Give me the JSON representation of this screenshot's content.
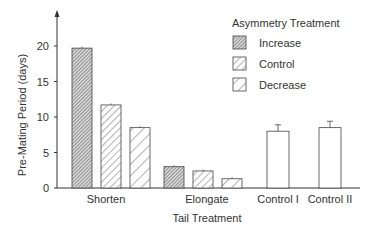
{
  "chart_data": {
    "type": "bar",
    "title": "",
    "xlabel": "Tail Treatment",
    "ylabel": "Pre-Mating Period (days)",
    "ylim": [
      0,
      24
    ],
    "yticks": [
      0,
      5,
      10,
      15,
      20
    ],
    "categories": [
      "Shorten",
      "Elongate",
      "Control I",
      "Control II"
    ],
    "legend_title": "Asymmetry Treatment",
    "series": [
      {
        "name": "Increase",
        "pattern": "dense-hatch",
        "values": [
          19.7,
          3.0,
          null,
          null
        ],
        "errors": [
          0.2,
          0.2,
          null,
          null
        ]
      },
      {
        "name": "Control",
        "pattern": "hatch",
        "values": [
          11.7,
          2.4,
          null,
          null
        ],
        "errors": [
          0.2,
          0.2,
          null,
          null
        ]
      },
      {
        "name": "Decrease",
        "pattern": "sparse-hatch",
        "values": [
          8.5,
          1.3,
          null,
          null
        ],
        "errors": [
          0.2,
          0.2,
          null,
          null
        ]
      }
    ],
    "control_bars": [
      {
        "category": "Control I",
        "value": 8.0,
        "error": 0.9
      },
      {
        "category": "Control II",
        "value": 8.5,
        "error": 0.9
      }
    ],
    "grid": false,
    "legend_position": "upper right"
  }
}
